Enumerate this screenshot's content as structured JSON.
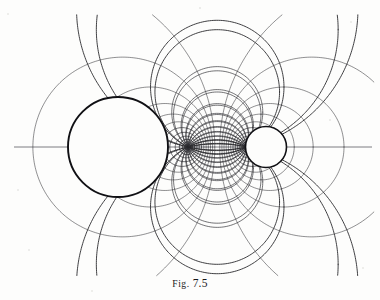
{
  "figure": {
    "caption_prefix": "Fig.",
    "caption_number": "7.5",
    "caption_full": "Fig. 7.5",
    "background_color": "#fdfdfc",
    "ink_color": "#2a2a2e",
    "heavy_ink_color": "#101014",
    "canvas": {
      "width": 380,
      "height": 300
    }
  },
  "chart_data": {
    "type": "line",
    "xlabel": "",
    "ylabel": "",
    "coordinate_system": "bipolar",
    "axis_of_symmetry_y": 147,
    "limit_points": [
      {
        "name": "left-limit-point",
        "x": 188.0,
        "y": 147
      },
      {
        "name": "right-limit-point",
        "x": 246.5,
        "y": 147
      }
    ],
    "focal_center_x": 217.25,
    "focal_half_separation": 29.25,
    "conductors": [
      {
        "name": "large-conductor-circle",
        "cx": 118,
        "cy": 147,
        "r": 50,
        "stroke_width": 1.9,
        "label": "large circle"
      },
      {
        "name": "small-conductor-circle",
        "cx": 266,
        "cy": 147,
        "r": 20.5,
        "stroke_width": 1.6,
        "label": "small circle"
      }
    ],
    "equipotential_sigma_values": [
      -2.95,
      -2.45,
      -2.05,
      -1.72,
      -1.44,
      -1.2,
      -0.99,
      -0.8,
      -0.63,
      -0.47,
      -0.32,
      -0.17,
      0.17,
      0.32,
      0.47,
      0.63,
      0.8,
      0.99,
      1.2,
      1.44,
      1.72,
      2.05,
      2.45,
      2.95
    ],
    "equipotential_count": 24,
    "fieldline_tau_values_deg": [
      14,
      28,
      42,
      56,
      70,
      84,
      98,
      112,
      126,
      140,
      154,
      168,
      -14,
      -28,
      -42,
      -56,
      -70,
      -84,
      -98,
      -112,
      -126,
      -140,
      -154,
      -168
    ],
    "fieldline_count": 24,
    "axis_line": {
      "name": "horizontal-axis",
      "x1": 14,
      "x2": 372,
      "y": 147
    },
    "grid": false,
    "legend": null
  },
  "speckles": [
    {
      "x": 8,
      "y": 14,
      "r": 1.1
    },
    {
      "x": 351,
      "y": 22,
      "r": 1.0
    },
    {
      "x": 29,
      "y": 250,
      "r": 0.9
    },
    {
      "x": 363,
      "y": 268,
      "r": 1.2
    },
    {
      "x": 200,
      "y": 8,
      "r": 0.8
    },
    {
      "x": 92,
      "y": 291,
      "r": 1.0
    },
    {
      "x": 330,
      "y": 120,
      "r": 0.8
    },
    {
      "x": 18,
      "y": 190,
      "r": 0.9
    }
  ]
}
